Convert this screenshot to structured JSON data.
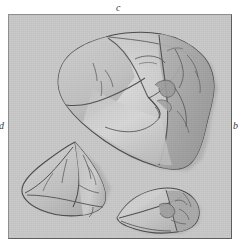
{
  "figure": {
    "kind": "scientific-illustration-plate",
    "labels": [
      {
        "id": "c",
        "text": "c",
        "position": "top-center"
      },
      {
        "id": "d",
        "text": "d",
        "position": "left-middle"
      },
      {
        "id": "b",
        "text": "b",
        "position": "right-middle"
      }
    ]
  },
  "panel": {
    "background_color": "#c9c9c9",
    "border_light_color": "#8f8f8f",
    "border_dark_color": "#5e5e5e",
    "width": 224,
    "height": 225
  },
  "palette": {
    "plate_background": "#c9c9c9",
    "specimen_light": "#d5d5d5",
    "specimen_mid": "#bdbdbd",
    "specimen_shadow": "#a2a2a2",
    "specimen_dark": "#8d8d8d",
    "outline": "#4a4a4a",
    "crack_line": "#5a5a5a",
    "label_text": "#3a3a3a"
  },
  "specimens": [
    {
      "name": "large-molar-occlusal",
      "position": "upper-center",
      "relative_size": "large",
      "notes": "Crown viewed from occlusal surface; broad basin with prominent central cusp junction and heavily textured right flank"
    },
    {
      "name": "small-molar-lingual",
      "position": "lower-left",
      "relative_size": "medium",
      "notes": "Triangular tooth with sharp apical cusp and crested ridges"
    },
    {
      "name": "small-molar-lateral",
      "position": "lower-right",
      "relative_size": "small",
      "notes": "Low elongate tooth in lateral view with crenulated posterior margin"
    }
  ]
}
